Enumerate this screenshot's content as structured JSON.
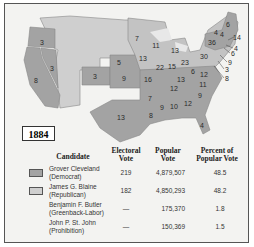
{
  "map": {
    "year": "1884",
    "colors": {
      "democrat": "#a3a3a3",
      "republican": "#cfcfcf",
      "background": "#f3f3f1",
      "water": "#e8e8e8"
    },
    "state_labels": [
      {
        "state": "OR",
        "votes": "3",
        "x": 42,
        "y": 42
      },
      {
        "state": "NV",
        "votes": "3",
        "x": 52,
        "y": 68
      },
      {
        "state": "CA",
        "votes": "8",
        "x": 36,
        "y": 80
      },
      {
        "state": "CO",
        "votes": "3",
        "x": 95,
        "y": 76
      },
      {
        "state": "NE",
        "votes": "5",
        "x": 119,
        "y": 62
      },
      {
        "state": "KS",
        "votes": "9",
        "x": 124,
        "y": 78
      },
      {
        "state": "TX",
        "votes": "13",
        "x": 121,
        "y": 117
      },
      {
        "state": "MN",
        "votes": "7",
        "x": 137,
        "y": 38
      },
      {
        "state": "IA",
        "votes": "13",
        "x": 143,
        "y": 58
      },
      {
        "state": "WI",
        "votes": "11",
        "x": 156,
        "y": 45
      },
      {
        "state": "MO",
        "votes": "16",
        "x": 148,
        "y": 79
      },
      {
        "state": "IL",
        "votes": "22",
        "x": 160,
        "y": 67
      },
      {
        "state": "IN",
        "votes": "15",
        "x": 172,
        "y": 66
      },
      {
        "state": "MI",
        "votes": "13",
        "x": 175,
        "y": 50
      },
      {
        "state": "OH",
        "votes": "23",
        "x": 185,
        "y": 62
      },
      {
        "state": "KY",
        "votes": "13",
        "x": 181,
        "y": 79
      },
      {
        "state": "TN",
        "votes": "12",
        "x": 174,
        "y": 88
      },
      {
        "state": "AR",
        "votes": "7",
        "x": 150,
        "y": 98
      },
      {
        "state": "LA",
        "votes": "8",
        "x": 151,
        "y": 115
      },
      {
        "state": "MS",
        "votes": "9",
        "x": 162,
        "y": 107
      },
      {
        "state": "AL",
        "votes": "10",
        "x": 174,
        "y": 106
      },
      {
        "state": "GA",
        "votes": "12",
        "x": 188,
        "y": 103
      },
      {
        "state": "FL",
        "votes": "4",
        "x": 202,
        "y": 125
      },
      {
        "state": "SC",
        "votes": "9",
        "x": 200,
        "y": 95
      },
      {
        "state": "NC",
        "votes": "11",
        "x": 203,
        "y": 84
      },
      {
        "state": "VA",
        "votes": "12",
        "x": 204,
        "y": 74
      },
      {
        "state": "WV",
        "votes": "6",
        "x": 193,
        "y": 71
      },
      {
        "state": "PA",
        "votes": "30",
        "x": 204,
        "y": 56
      },
      {
        "state": "NY",
        "votes": "36",
        "x": 212,
        "y": 42
      },
      {
        "state": "VT",
        "votes": "4",
        "x": 216,
        "y": 32
      },
      {
        "state": "NH",
        "votes": "4",
        "x": 222,
        "y": 34
      },
      {
        "state": "ME",
        "votes": "6",
        "x": 228,
        "y": 24
      }
    ],
    "callouts": [
      {
        "state": "MA",
        "votes": "14",
        "x": 237,
        "y": 37
      },
      {
        "state": "RI",
        "votes": "4",
        "x": 236,
        "y": 48
      },
      {
        "state": "CT",
        "votes": "6",
        "x": 233,
        "y": 53
      },
      {
        "state": "NJ",
        "votes": "9",
        "x": 230,
        "y": 62
      },
      {
        "state": "DE",
        "votes": "3",
        "x": 227,
        "y": 69
      },
      {
        "state": "MD",
        "votes": "8",
        "x": 227,
        "y": 78
      }
    ]
  },
  "legend": {
    "headers": {
      "candidate": "Candidate",
      "electoral_vote": "Electoral Vote",
      "popular_vote": "Popular Vote",
      "percent": "Percent of Popular Vote"
    },
    "rows": [
      {
        "name": "Grover Cleveland",
        "party": "(Democrat)",
        "electoral": "219",
        "popular": "4,879,507",
        "percent": "48.5",
        "swatch": "#a3a3a3"
      },
      {
        "name": "James G. Blaine",
        "party": "(Republican)",
        "electoral": "182",
        "popular": "4,850,293",
        "percent": "48.2",
        "swatch": "#cfcfcf"
      },
      {
        "name": "Benjamin F. Butler",
        "party": "(Greenback-Labor)",
        "electoral": "—",
        "popular": "175,370",
        "percent": "1.8",
        "swatch": ""
      },
      {
        "name": "John P. St. John",
        "party": "(Prohibition)",
        "electoral": "—",
        "popular": "150,369",
        "percent": "1.5",
        "swatch": ""
      }
    ]
  }
}
